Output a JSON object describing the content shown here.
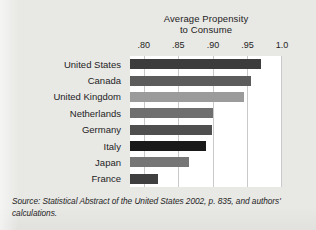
{
  "chart_data": {
    "type": "bar",
    "orientation": "horizontal",
    "title": "Average Propensity to Consume",
    "title_lines": [
      "Average Propensity",
      "to Consume"
    ],
    "xlabel": "",
    "ylabel": "",
    "xlim": [
      0.78,
      1.0
    ],
    "axis_start": 0.78,
    "grid": true,
    "grid_axis": "x",
    "legend": false,
    "tick_labels": [
      ".80",
      ".85",
      ".90",
      ".95",
      "1.0"
    ],
    "tick_values": [
      0.8,
      0.85,
      0.9,
      0.95,
      1.0
    ],
    "categories": [
      "United States",
      "Canada",
      "United Kingdom",
      "Netherlands",
      "Germany",
      "Italy",
      "Japan",
      "France"
    ],
    "values": [
      0.97,
      0.955,
      0.945,
      0.9,
      0.899,
      0.89,
      0.865,
      0.82
    ],
    "bar_colors": [
      "#3c3c3c",
      "#5c5c5c",
      "#9b9b9b",
      "#6f6f6f",
      "#4f4f4f",
      "#191919",
      "#767676",
      "#3f3f3f"
    ],
    "bars": [
      {
        "label": "United States",
        "value": 0.97,
        "color": "#3c3c3c"
      },
      {
        "label": "Canada",
        "value": 0.955,
        "color": "#5c5c5c"
      },
      {
        "label": "United Kingdom",
        "value": 0.945,
        "color": "#9b9b9b"
      },
      {
        "label": "Netherlands",
        "value": 0.9,
        "color": "#6f6f6f"
      },
      {
        "label": "Germany",
        "value": 0.899,
        "color": "#4f4f4f"
      },
      {
        "label": "Italy",
        "value": 0.89,
        "color": "#191919"
      },
      {
        "label": "Japan",
        "value": 0.865,
        "color": "#767676"
      },
      {
        "label": "France",
        "value": 0.82,
        "color": "#3f3f3f"
      }
    ]
  },
  "source_note": {
    "line1": "Source: Statistical Abstract of the United States 2002, p. 835, and authors'",
    "line2": "calculations.",
    "full": "Source: Statistical Abstract of the United States 2002, p. 835, and authors' calculations."
  },
  "colors": {
    "page_background": "#e8e8e5",
    "plot_background": "#ffffff",
    "gridline": "#c9c9c9",
    "text": "#1d1d1d"
  }
}
